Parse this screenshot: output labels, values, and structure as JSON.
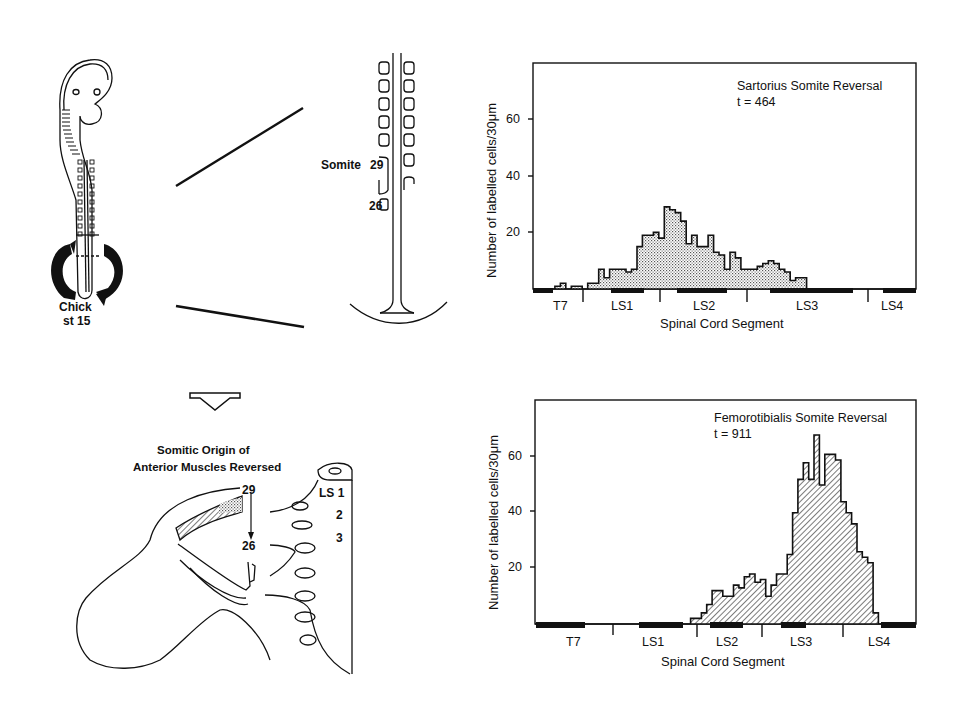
{
  "figure": {
    "panel_a": {
      "label_line1": "Chick",
      "label_line2": "st 15",
      "somite_label": "Somite",
      "somite_top_number": "29",
      "somite_bottom_number": "26"
    },
    "panel_b": {
      "title_line1": "Somitic Origin of",
      "title_line2": "Anterior Muscles Reversed",
      "top_number": "29",
      "bottom_number": "26",
      "segment_labels": [
        "LS 1",
        "2",
        "3"
      ]
    }
  },
  "chart_data": [
    {
      "type": "bar",
      "title": "Sartorius Somite Reversal",
      "subtitle": "t = 464",
      "xlabel": "Spinal Cord Segment",
      "ylabel": "Number of labelled cells/30μm",
      "yticks": [
        "20",
        "40",
        "60"
      ],
      "ylim": [
        0,
        80
      ],
      "categories": [
        "T7",
        "LS1",
        "LS2",
        "LS3",
        "LS4"
      ],
      "fill": "stipple",
      "values": [
        0,
        0,
        0,
        0,
        1,
        2,
        0,
        1,
        1,
        0,
        2,
        2,
        7,
        4,
        7,
        7,
        7,
        6,
        7,
        15,
        19,
        19,
        20,
        18,
        29,
        28,
        27,
        24,
        16,
        19,
        15,
        15,
        19,
        13,
        12,
        7,
        13,
        11,
        7,
        7,
        7,
        8,
        9,
        10,
        9,
        7,
        6,
        3,
        4,
        4,
        0,
        0,
        0,
        0,
        0,
        0,
        0,
        0,
        0,
        0,
        0,
        0,
        0,
        0,
        0,
        0,
        0,
        0,
        0,
        0
      ]
    },
    {
      "type": "bar",
      "title": "Femorotibialis Somite Reversal",
      "subtitle": "t = 911",
      "xlabel": "Spinal Cord Segment",
      "ylabel": "Number of labelled cells/30μm",
      "yticks": [
        "20",
        "40",
        "60"
      ],
      "ylim": [
        0,
        80
      ],
      "categories": [
        "T7",
        "LS1",
        "LS2",
        "LS3",
        "LS4"
      ],
      "fill": "hatch",
      "values": [
        0,
        0,
        0,
        0,
        0,
        0,
        0,
        0,
        0,
        0,
        0,
        0,
        0,
        0,
        0,
        0,
        0,
        0,
        0,
        0,
        0,
        0,
        0,
        0,
        0,
        0,
        0,
        0,
        0,
        2,
        2,
        4,
        7,
        12,
        12,
        10,
        10,
        14,
        13,
        17,
        18,
        15,
        16,
        10,
        14,
        18,
        18,
        25,
        40,
        52,
        58,
        52,
        68,
        50,
        61,
        61,
        59,
        44,
        40,
        36,
        26,
        24,
        22,
        4,
        0,
        0,
        0,
        0,
        0,
        0,
        0
      ]
    }
  ]
}
